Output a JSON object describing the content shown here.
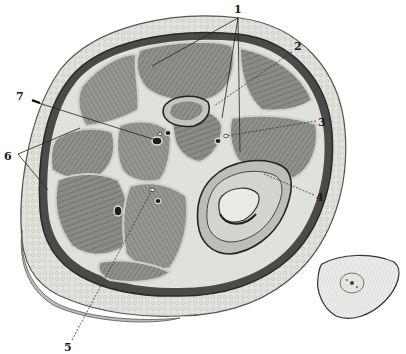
{
  "figure": {
    "colors": {
      "background": "#ffffff",
      "skin": "#e9e9e6",
      "fat": "#d8d8d4",
      "fascia": "#3a3a3a",
      "muscle": "#8d8d8a",
      "muscle_dark": "#6f6f6c",
      "septum": "#dcdcd8",
      "bone_outer": "#cfcfcb",
      "bone_inner": "#e6e6e2",
      "vessel": "#1e1e1e",
      "ink": "#1a1a1a"
    },
    "labels": [
      {
        "id": "1",
        "text": "1",
        "x": 238,
        "y": 13
      },
      {
        "id": "2",
        "text": "2",
        "x": 297,
        "y": 48
      },
      {
        "id": "3",
        "text": "3",
        "x": 320,
        "y": 124
      },
      {
        "id": "4",
        "text": "4",
        "x": 318,
        "y": 199
      },
      {
        "id": "5",
        "text": "5",
        "x": 68,
        "y": 352
      },
      {
        "id": "6",
        "text": "6",
        "x": 6,
        "y": 159
      },
      {
        "id": "7",
        "text": "7",
        "x": 18,
        "y": 97
      }
    ],
    "inset": {
      "name": "small-cross-section-inset",
      "description": "Small separate transverse section, lower right"
    }
  }
}
